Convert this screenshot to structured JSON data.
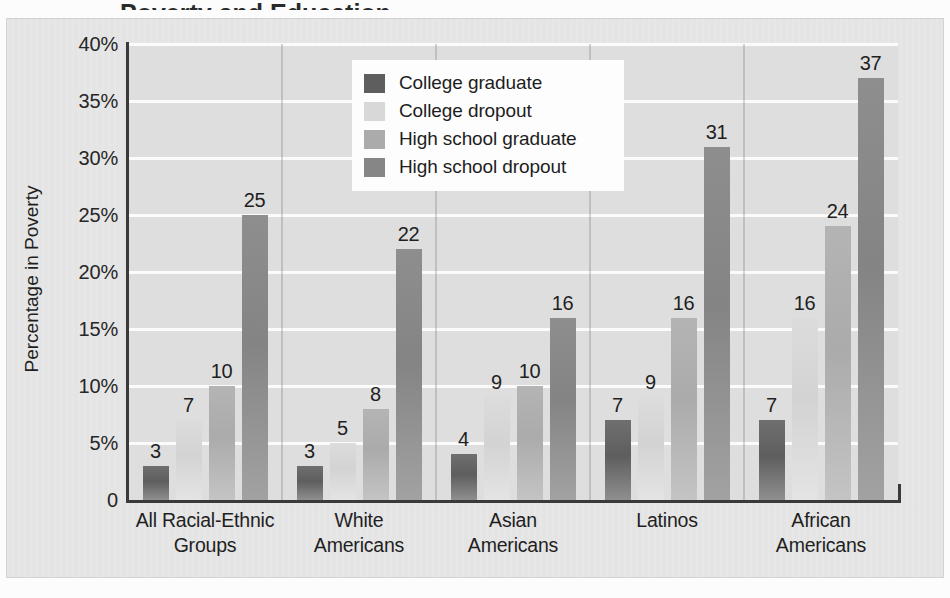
{
  "figure": {
    "title_fragment": "Poverty and Education",
    "y_axis_title": "Percentage in Poverty",
    "zero_label": "0"
  },
  "legend": {
    "items": [
      {
        "label": "College graduate",
        "color": "#5e5e5e"
      },
      {
        "label": "College dropout",
        "color": "#d8d8d8"
      },
      {
        "label": "High school graduate",
        "color": "#ababab"
      },
      {
        "label": "High school dropout",
        "color": "#868686"
      }
    ]
  },
  "chart_data": {
    "type": "bar",
    "title": "Poverty and Education",
    "xlabel": "",
    "ylabel": "Percentage in Poverty",
    "ylim": [
      0,
      40
    ],
    "ytick_labels": [
      "40%",
      "35%",
      "30%",
      "25%",
      "20%",
      "15%",
      "10%",
      "5%",
      "0"
    ],
    "ytick_values": [
      40,
      35,
      30,
      25,
      20,
      15,
      10,
      5,
      0
    ],
    "grid": true,
    "legend_position": "upper center",
    "categories": [
      "All Racial-Ethnic Groups",
      "White Americans",
      "Asian Americans",
      "Latinos",
      "African Americans"
    ],
    "category_lines": [
      [
        "All Racial-Ethnic",
        "Groups"
      ],
      [
        "White",
        "Americans"
      ],
      [
        "Asian",
        "Americans"
      ],
      [
        "Latinos",
        ""
      ],
      [
        "African",
        "Americans"
      ]
    ],
    "series": [
      {
        "name": "College graduate",
        "color": "#5e5e5e",
        "values": [
          3,
          3,
          4,
          7,
          7
        ]
      },
      {
        "name": "College dropout",
        "color": "#d8d8d8",
        "values": [
          7,
          5,
          9,
          9,
          16
        ]
      },
      {
        "name": "High school graduate",
        "color": "#ababab",
        "values": [
          10,
          8,
          10,
          16,
          24
        ]
      },
      {
        "name": "High school dropout",
        "color": "#868686",
        "values": [
          25,
          22,
          16,
          31,
          37
        ]
      }
    ]
  }
}
